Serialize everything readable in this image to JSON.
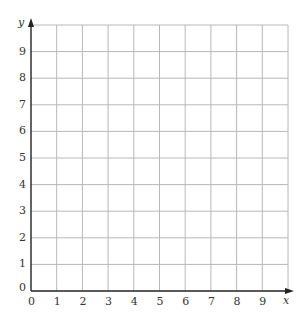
{
  "chart_data": {
    "type": "scatter",
    "title": "",
    "xlabel": "x",
    "ylabel": "y",
    "xlim": [
      0,
      10
    ],
    "ylim": [
      0,
      10
    ],
    "x_ticks": [
      "0",
      "1",
      "2",
      "3",
      "4",
      "5",
      "6",
      "7",
      "8",
      "9"
    ],
    "y_ticks": [
      "0",
      "1",
      "2",
      "3",
      "4",
      "5",
      "6",
      "7",
      "8",
      "9"
    ],
    "grid": true,
    "series": [],
    "colors": {
      "grid": "#b8b8b8",
      "axis": "#222222"
    }
  },
  "axes": {
    "x_label": "x",
    "y_label": "y"
  }
}
